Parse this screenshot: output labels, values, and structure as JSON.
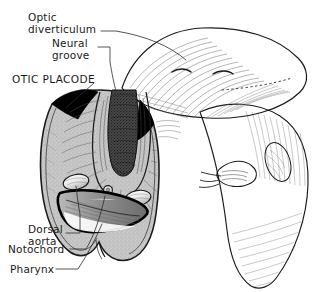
{
  "figure": {
    "background_color": "#ffffff",
    "ink_color": "#1b1b1b",
    "tissue_fill_color": "#c8c8c8",
    "dark_structure_color": "#000000",
    "cavity_fill_color": "#f2f2f2"
  },
  "labels": [
    {
      "id": "optic-diverticulum",
      "lines": [
        "Optic",
        "diverticulum"
      ],
      "line1": "Optic",
      "line2": "diverticulum",
      "style": "sentence-case",
      "x": 28,
      "y": 14
    },
    {
      "id": "neural-groove",
      "lines": [
        "Neural",
        "groove"
      ],
      "line1": "Neural",
      "line2": "groove",
      "style": "sentence-case",
      "x": 52,
      "y": 42
    },
    {
      "id": "otic-placode",
      "lines": [
        "OTIC PLACODE"
      ],
      "line1": "OTIC PLACODE",
      "line2": "",
      "style": "all-caps",
      "x": 12,
      "y": 79
    },
    {
      "id": "dorsal-aorta",
      "lines": [
        "Dorsal",
        "aorta"
      ],
      "line1": "Dorsal",
      "line2": "aorta",
      "style": "sentence-case",
      "x": 28,
      "y": 228
    },
    {
      "id": "notochord",
      "lines": [
        "Notochord"
      ],
      "line1": "Notochord",
      "line2": "",
      "style": "sentence-case",
      "x": 8,
      "y": 252
    },
    {
      "id": "pharynx",
      "lines": [
        "Pharynx"
      ],
      "line1": "Pharynx",
      "line2": "",
      "style": "sentence-case",
      "x": 10,
      "y": 272
    }
  ],
  "structures": [
    {
      "id": "neural-fold-left",
      "name": "left neural fold"
    },
    {
      "id": "neural-fold-right",
      "name": "right neural fold"
    },
    {
      "id": "neural-groove",
      "name": "neural groove"
    },
    {
      "id": "otic-placode-left",
      "name": "left otic placode"
    },
    {
      "id": "otic-placode-right",
      "name": "right otic placode"
    },
    {
      "id": "dorsal-aorta-left",
      "name": "left dorsal aorta"
    },
    {
      "id": "dorsal-aorta-right",
      "name": "right dorsal aorta"
    },
    {
      "id": "notochord",
      "name": "notochord"
    },
    {
      "id": "pharynx",
      "name": "pharynx"
    },
    {
      "id": "embryo-body",
      "name": "embryo body surface"
    },
    {
      "id": "optic-diverticulum",
      "name": "optic diverticulum"
    }
  ]
}
